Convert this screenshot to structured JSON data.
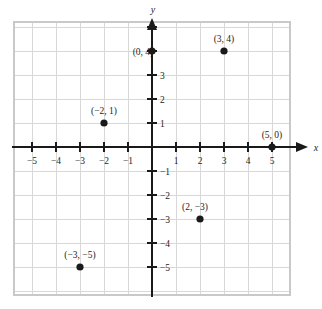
{
  "chart_data": {
    "type": "scatter",
    "title": "",
    "subtitle": "",
    "xlabel": "x",
    "ylabel": "y",
    "xlim": [
      -5.75,
      5.75
    ],
    "ylim": [
      -6.2,
      5.2
    ],
    "grid": true,
    "legend": "none",
    "x_ticks": [
      -5,
      -4,
      -3,
      -2,
      -1,
      1,
      2,
      3,
      4,
      5
    ],
    "x_tick_labels": [
      "−5",
      "−4",
      "−3",
      "−2",
      "−1",
      "1",
      "2",
      "3",
      "4",
      "5"
    ],
    "y_ticks": [
      -5,
      -4,
      -3,
      -2,
      -1,
      1,
      2,
      3
    ],
    "y_tick_labels": [
      "−5",
      "−4",
      "−3",
      "−2",
      "−1",
      "1",
      "2",
      "3"
    ],
    "points": [
      {
        "x": 0,
        "y": 4,
        "label": "(0, 4)",
        "label_pos": "left"
      },
      {
        "x": 3,
        "y": 4,
        "label": "(3, 4)",
        "label_pos": "above"
      },
      {
        "x": -2,
        "y": 1,
        "label": "(−2, 1)",
        "label_pos": "above"
      },
      {
        "x": 5,
        "y": 0,
        "label": "(5, 0)",
        "label_pos": "above"
      },
      {
        "x": 2,
        "y": -3,
        "label": "(2, −3)",
        "label_pos": "above-left"
      },
      {
        "x": -3,
        "y": -5,
        "label": "(−3, −5)",
        "label_pos": "above"
      }
    ],
    "colors": {
      "point": "#1a1a1a",
      "axis": "#1a1a1a",
      "grid": "#d8d8d8",
      "background": "#ffffff",
      "text": "#1d1d1d"
    }
  }
}
